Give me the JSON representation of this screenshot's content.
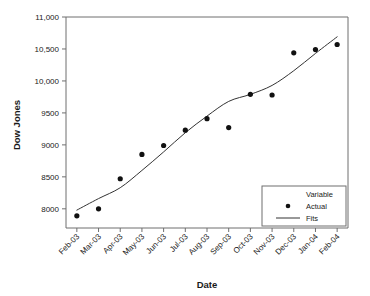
{
  "chart_data": {
    "type": "scatter",
    "title": "",
    "xlabel": "Date",
    "ylabel": "Dow Jones",
    "categories": [
      "Feb-03",
      "Mar-03",
      "Apr-03",
      "May-03",
      "Jun-03",
      "Jul-03",
      "Aug-03",
      "Sep-03",
      "Oct-03",
      "Nov-03",
      "Dec-03",
      "Jan-04",
      "Feb-04"
    ],
    "ylim": [
      7700,
      11000
    ],
    "yticks": [
      8000,
      8500,
      9000,
      9500,
      10000,
      10500,
      11000
    ],
    "ytick_labels": [
      "8000",
      "8500",
      "9000",
      "9500",
      "10,000",
      "10,500",
      "11,000"
    ],
    "grid": false,
    "legend_position": "lower-right",
    "legend_title": "Variable",
    "series": [
      {
        "name": "Actual",
        "marker": "circle",
        "color": "#111111",
        "values": [
          7890,
          8000,
          8470,
          8850,
          8990,
          9230,
          9410,
          9270,
          9790,
          9780,
          10440,
          10490,
          10570
        ]
      },
      {
        "name": "Fits",
        "marker": "line",
        "color": "#333333",
        "values": [
          7980,
          8160,
          8330,
          8600,
          8890,
          9190,
          9450,
          9680,
          9790,
          9930,
          10160,
          10430,
          10690
        ]
      }
    ]
  },
  "axes": {
    "y_title": "Dow Jones",
    "x_title": "Date"
  },
  "legend": {
    "title": "Variable",
    "items": [
      {
        "label": "Actual",
        "symbol": "dot"
      },
      {
        "label": "Fits",
        "symbol": "line"
      }
    ]
  }
}
